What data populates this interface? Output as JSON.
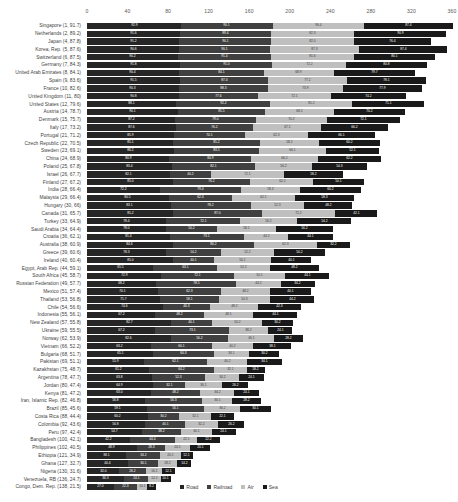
{
  "chart_data": {
    "type": "bar",
    "subtype": "stacked-horizontal-bar",
    "title": "",
    "subtitle": "",
    "xlabel": "",
    "ylabel": "",
    "xlim": [
      0,
      360
    ],
    "xticks": [
      0,
      40,
      80,
      120,
      160,
      200,
      240,
      280,
      320,
      360
    ],
    "grid": false,
    "legend_position": "bottom",
    "orientation": "horizontal",
    "stacked": true,
    "series_names": [
      "Road",
      "Railroad",
      "Air",
      "Sea"
    ],
    "series_colors": [
      "#262626",
      "#404040",
      "#bfbfbf",
      "#1a1a1a"
    ],
    "categories": [
      "Singapore (1, 91.7)",
      "Netherlands (2, 89.2)",
      "Japan (4, 87.8)",
      "Korea, Rep. (5, 87.6)",
      "Switzerland (6, 87.5)",
      "Germany (7, 84.3)",
      "United Arab Emirates (8, 84.1)",
      "Spain (9, 83.6)",
      "France (10, 82.6)",
      "United Kingdom (11, 80)",
      "United States (12, 79.6)",
      "Austria (14, 78.7)",
      "Denmark (15, 75.7)",
      "Italy (17, 73.2)",
      "Portugal (21, 71.2)",
      "Czech Republic (22, 70.5)",
      "Sweden (23, 69.1)",
      "China (24, 68.9)",
      "Poland (25, 67.8)",
      "Israel (26, 67.7)",
      "Finland (27, 67.2)",
      "India (28, 66.4)",
      "Malaysia (29, 66.4)",
      "Hungary (30, 66)",
      "Canada (31, 65.7)",
      "Turkey (33, 64.9)",
      "Saudi Arabia (34, 64.4)",
      "Croatia (36, 62.1)",
      "Australia (38, 60.9)",
      "Greece (39, 60.6)",
      "Ireland (40, 60.4)",
      "Egypt, Arab Rep. (44, 59.1)",
      "South Africa (45, 58.7)",
      "Russian Federation (49, 57.7)",
      "Mexico (51, 57.4)",
      "Thailand (53, 56.8)",
      "Chile (54, 56.6)",
      "Indonesia (55, 56.1)",
      "New Zealand (57, 55.8)",
      "Ukraine (59, 55.5)",
      "Norway (62, 53.9)",
      "Vietnam (66, 52.2)",
      "Bulgaria (68, 51.7)",
      "Pakistan (69, 51.1)",
      "Kazakhstan (75, 48.7)",
      "Argentina (78, 47.7)",
      "Jordan (80, 47.4)",
      "Kenya (81, 47.2)",
      "Iran, Islamic Rep. (82, 46.8)",
      "Brazil (85, 45.6)",
      "Costa Rica (88, 44.4)",
      "Colombia (92, 43.6)",
      "Peru (97, 42.4)",
      "Bangladesh (100, 42.1)",
      "Philippines (102, 40.5)",
      "Ethiopia (121, 34.9)",
      "Ghana (127, 32.7)",
      "Nigeria (130, 31.6)",
      "Venezuela, RB (136, 24.7)",
      "Congo, Dem. Rep. (138, 21.5)"
    ],
    "series": [
      {
        "name": "Road",
        "values": [
          92.9,
          91.6,
          91.2,
          90.6,
          90.2,
          91.8,
          90.4,
          91.5,
          90.3,
          90.8,
          88.1,
          90.1,
          87.2,
          87.6,
          85.9,
          85.1,
          86.2,
          80.9,
          83.4,
          82.1,
          85.0,
          72.2,
          80.5,
          83.1,
          85.2,
          78.4,
          78.0,
          81.4,
          84.6,
          78.3,
          85.0,
          65.5,
          72.9,
          68.2,
          70.1,
          71.7,
          74.6,
          67.2,
          82.7,
          67.2,
          82.6,
          63.2,
          65.1,
          55.9,
          61.2,
          63.8,
          64.9,
          63.0,
          56.8,
          59.1,
          60.2,
          56.8,
          54.7,
          42.2,
          48.9,
          38.1,
          40.4,
          32.0,
          36.3,
          27.0
        ]
      },
      {
        "name": "Railroad",
        "values": [
          90.1,
          89.4,
          90.1,
          90.1,
          91.4,
          91.0,
          84.1,
          87.4,
          88.3,
          77.6,
          92.2,
          85.5,
          79.0,
          76.2,
          70.1,
          85.2,
          83.5,
          80.9,
          82.1,
          40.2,
          76.2,
          79.4,
          62.3,
          78.2,
          87.0,
          72.1,
          50.2,
          73.1,
          80.2,
          54.2,
          40.1,
          63.1,
          72.1,
          78.5,
          62.3,
          58.1,
          46.3,
          48.2,
          40.1,
          73.1,
          56.2,
          60.1,
          60.3,
          62.1,
          64.2,
          52.3,
          32.1,
          48.2,
          56.3,
          56.1,
          30.2,
          40.1,
          38.2,
          44.4,
          28.3,
          34.2,
          30.1,
          26.2,
          24.1,
          22.3
        ]
      },
      {
        "name": "Air",
        "values": [
          90.4,
          82.3,
          82.0,
          87.3,
          81.6,
          72.2,
          68.9,
          77.2,
          73.9,
          72.1,
          81.2,
          68.2,
          70.2,
          67.1,
          62.3,
          58.2,
          66.1,
          66.2,
          56.2,
          72.1,
          62.2,
          58.3,
          62.1,
          52.3,
          72.2,
          56.2,
          58.1,
          44.2,
          62.3,
          52.2,
          56.1,
          52.2,
          50.1,
          44.2,
          48.2,
          50.3,
          48.2,
          48.1,
          50.2,
          38.2,
          46.1,
          40.2,
          34.1,
          40.2,
          32.1,
          34.2,
          36.1,
          34.2,
          30.1,
          36.2,
          32.1,
          32.2,
          30.1,
          22.1,
          24.2,
          20.1,
          18.2,
          16.1,
          12.2,
          10.1
        ]
      },
      {
        "name": "Sea",
        "values": [
          87.4,
          90.9,
          76.4,
          87.4,
          80.1,
          80.8,
          79.7,
          78.1,
          77.9,
          74.2,
          71.1,
          70.2,
          72.1,
          66.2,
          66.1,
          60.2,
          52.1,
          62.2,
          54.3,
          58.2,
          50.1,
          60.2,
          58.3,
          48.2,
          42.1,
          54.2,
          56.2,
          44.1,
          32.2,
          50.2,
          40.1,
          48.2,
          44.1,
          34.2,
          40.1,
          44.2,
          42.3,
          44.1,
          30.2,
          24.1,
          28.2,
          38.1,
          30.2,
          34.1,
          18.2,
          24.1,
          26.2,
          24.1,
          28.2,
          30.1,
          22.1,
          26.2,
          24.1,
          22.2,
          20.1,
          12.1,
          14.2,
          12.1,
          10.1,
          8.2
        ]
      }
    ],
    "legend": [
      {
        "label": "Road",
        "color": "#262626"
      },
      {
        "label": "Railroad",
        "color": "#404040"
      },
      {
        "label": "Air",
        "color": "#bfbfbf"
      },
      {
        "label": "Sea",
        "color": "#1a1a1a"
      }
    ]
  }
}
